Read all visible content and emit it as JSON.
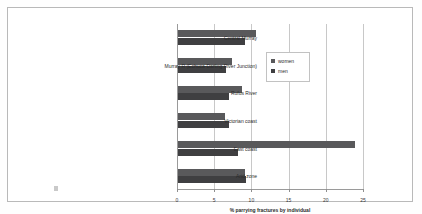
{
  "chart_data": {
    "type": "bar",
    "orientation": "horizontal",
    "title": "",
    "xlabel": "% parrying fractures by individual",
    "ylabel": "",
    "xlim": [
      0,
      25
    ],
    "xticks": [
      0,
      5,
      10,
      15,
      20,
      25
    ],
    "grid": true,
    "legend_position": "top-right",
    "categories": [
      "Central Murray",
      "Murray R (Echuca-Darling River Junction)",
      "Rufus River",
      "Victorian coast",
      "East coast",
      "Arid zone"
    ],
    "series": [
      {
        "name": "women",
        "color": "#59595b",
        "values": [
          10.5,
          7.2,
          8.6,
          6.3,
          23.8,
          9.0
        ]
      },
      {
        "name": "men",
        "color": "#3f3f41",
        "values": [
          9.0,
          6.4,
          6.9,
          6.8,
          8.0,
          9.2
        ]
      }
    ]
  },
  "legend": {
    "items": [
      {
        "label": "women"
      },
      {
        "label": "men"
      }
    ]
  },
  "axis": {
    "tick_labels": [
      "0",
      "5",
      "10",
      "15",
      "20",
      "25"
    ],
    "title": "% parrying fractures by individual"
  }
}
